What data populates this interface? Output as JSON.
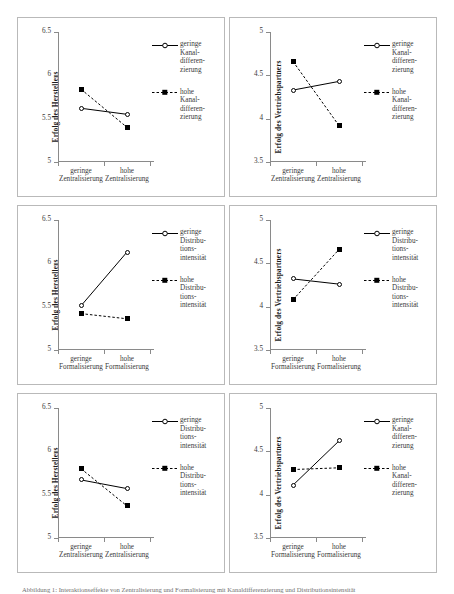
{
  "figure": {
    "caption": "Abbildung 1: Interaktionseffekte von Zentralisierung und Formalisierung mit Kanaldifferenzierung und Distributionsintensität"
  },
  "style": {
    "line_color": "#000000",
    "marker_open_fill": "#ffffff",
    "marker_closed_fill": "#000000",
    "axis_color": "#8a8a8a",
    "panel_border": "#b9b9b9"
  },
  "chart_data": [
    {
      "id": "panel-1",
      "type": "line",
      "position": "top-left",
      "title": "",
      "xlabel": "",
      "ylabel": "Erfolg des Herstellers",
      "categories": [
        "geringe Zentralisierung",
        "hohe Zentralisierung"
      ],
      "category_lines": [
        [
          "geringe",
          "Zentralisierung"
        ],
        [
          "hohe",
          "Zentralisierung"
        ]
      ],
      "ylim": [
        5,
        6.5
      ],
      "yticks": [
        5,
        5.5,
        6,
        6.5
      ],
      "ytick_labels": [
        "5",
        "5.5",
        "6",
        "6.5"
      ],
      "grid": false,
      "legend_position": "right",
      "series": [
        {
          "name": "geringe Kanal-differen-zierung",
          "name_lines": [
            "geringe",
            "Kanal-",
            "differen-",
            "zierung"
          ],
          "marker": "open-circle",
          "line": "solid",
          "values": [
            5.62,
            5.55
          ]
        },
        {
          "name": "hohe Kanal-differen-zierung",
          "name_lines": [
            "hohe",
            "Kanal-",
            "differen-",
            "zierung"
          ],
          "marker": "filled-square",
          "line": "dashed",
          "values": [
            5.84,
            5.4
          ]
        }
      ]
    },
    {
      "id": "panel-2",
      "type": "line",
      "position": "top-right",
      "title": "",
      "xlabel": "",
      "ylabel": "Erfolg des Vertriebspartners",
      "categories": [
        "geringe Zentralisierung",
        "hohe Zentralisierung"
      ],
      "category_lines": [
        [
          "geringe",
          "Zentralisierung"
        ],
        [
          "hohe",
          "Zentralisierung"
        ]
      ],
      "ylim": [
        3.5,
        5
      ],
      "yticks": [
        3.5,
        4,
        4.5,
        5
      ],
      "ytick_labels": [
        "3.5",
        "4",
        "4.5",
        "5"
      ],
      "grid": false,
      "legend_position": "right",
      "series": [
        {
          "name": "geringe Kanal-differen-zierung",
          "name_lines": [
            "geringe",
            "Kanal-",
            "differen-",
            "zierung"
          ],
          "marker": "open-circle",
          "line": "solid",
          "values": [
            4.33,
            4.43
          ]
        },
        {
          "name": "hohe Kanal-differen-zierung",
          "name_lines": [
            "hohe",
            "Kanal-",
            "differen-",
            "zierung"
          ],
          "marker": "filled-square",
          "line": "dashed",
          "values": [
            4.66,
            3.92
          ]
        }
      ]
    },
    {
      "id": "panel-3",
      "type": "line",
      "position": "middle-left",
      "title": "",
      "xlabel": "",
      "ylabel": "Erfolg des Herstellers",
      "categories": [
        "geringe Formalisierung",
        "hohe Formalisierung"
      ],
      "category_lines": [
        [
          "geringe",
          "Formalisierung"
        ],
        [
          "hohe",
          "Formalisierung"
        ]
      ],
      "ylim": [
        5,
        6.5
      ],
      "yticks": [
        5,
        5.5,
        6,
        6.5
      ],
      "ytick_labels": [
        "5",
        "5.5",
        "6",
        "6.5"
      ],
      "grid": false,
      "legend_position": "right",
      "series": [
        {
          "name": "geringe Distributions-intensität",
          "name_lines": [
            "geringe",
            "Distribu-",
            "tions-",
            "intensität"
          ],
          "marker": "open-circle",
          "line": "solid",
          "values": [
            5.51,
            6.13
          ]
        },
        {
          "name": "hohe Distributions-intensität",
          "name_lines": [
            "hohe",
            "Distribu-",
            "tions-",
            "intensität"
          ],
          "marker": "filled-square",
          "line": "dashed",
          "values": [
            5.42,
            5.36
          ]
        }
      ]
    },
    {
      "id": "panel-4",
      "type": "line",
      "position": "middle-right",
      "title": "",
      "xlabel": "",
      "ylabel": "Erfolg des Vertriebspartners",
      "categories": [
        "geringe Formalisierung",
        "hohe Formalisierung"
      ],
      "category_lines": [
        [
          "geringe",
          "Formalisierung"
        ],
        [
          "hohe",
          "Formalisierung"
        ]
      ],
      "ylim": [
        3.5,
        5
      ],
      "yticks": [
        3.5,
        4,
        4.5,
        5
      ],
      "ytick_labels": [
        "3.5",
        "4",
        "4.5",
        "5"
      ],
      "grid": false,
      "legend_position": "right",
      "series": [
        {
          "name": "geringe Distributions-intensität",
          "name_lines": [
            "geringe",
            "Distribu-",
            "tions-",
            "intensität"
          ],
          "marker": "open-circle",
          "line": "solid",
          "values": [
            4.32,
            4.26
          ]
        },
        {
          "name": "hohe Distributions-intensität",
          "name_lines": [
            "hohe",
            "Distribu-",
            "tions-",
            "intensität"
          ],
          "marker": "filled-square",
          "line": "dashed",
          "values": [
            4.08,
            4.66
          ]
        }
      ]
    },
    {
      "id": "panel-5",
      "type": "line",
      "position": "bottom-left",
      "title": "",
      "xlabel": "",
      "ylabel": "Erfolg des Herstellers",
      "categories": [
        "geringe Zentralisierung",
        "hohe Zentralisierung"
      ],
      "category_lines": [
        [
          "geringe",
          "Zentralisierung"
        ],
        [
          "hohe",
          "Zentralisierung"
        ]
      ],
      "ylim": [
        5,
        6.5
      ],
      "yticks": [
        5,
        5.5,
        6,
        6.5
      ],
      "ytick_labels": [
        "5",
        "5.5",
        "6",
        "6.5"
      ],
      "grid": false,
      "legend_position": "right",
      "series": [
        {
          "name": "geringe Distributions-intensität",
          "name_lines": [
            "geringe",
            "Distribu-",
            "tions-",
            "intensität"
          ],
          "marker": "open-circle",
          "line": "solid",
          "values": [
            5.67,
            5.57
          ]
        },
        {
          "name": "hohe Distributions-intensität",
          "name_lines": [
            "hohe",
            "Distribu-",
            "tions-",
            "intensität"
          ],
          "marker": "filled-square",
          "line": "dashed",
          "values": [
            5.8,
            5.37
          ]
        }
      ]
    },
    {
      "id": "panel-6",
      "type": "line",
      "position": "bottom-right",
      "title": "",
      "xlabel": "",
      "ylabel": "Erfolg des Vertriebspartners",
      "categories": [
        "geringe Formalisierung",
        "hohe Formalisierung"
      ],
      "category_lines": [
        [
          "geringe",
          "Formalisierung"
        ],
        [
          "hohe",
          "Formalisierung"
        ]
      ],
      "ylim": [
        3.5,
        5
      ],
      "yticks": [
        3.5,
        4,
        4.5,
        5
      ],
      "ytick_labels": [
        "3.5",
        "4",
        "4.5",
        "5"
      ],
      "grid": false,
      "legend_position": "right",
      "series": [
        {
          "name": "geringe Kanal-differen-zierung",
          "name_lines": [
            "geringe",
            "Kanal-",
            "differen-",
            "zierung"
          ],
          "marker": "open-circle",
          "line": "solid",
          "values": [
            4.11,
            4.62
          ]
        },
        {
          "name": "hohe Kanal-differen-zierung",
          "name_lines": [
            "hohe",
            "Kanal-",
            "differen-",
            "zierung"
          ],
          "marker": "filled-square",
          "line": "dashed",
          "values": [
            4.29,
            4.31
          ]
        }
      ]
    }
  ]
}
